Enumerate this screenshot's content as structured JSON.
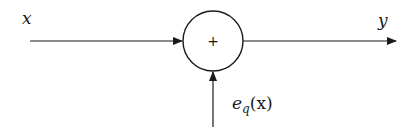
{
  "diagram": {
    "type": "block-diagram",
    "nodes": [
      {
        "id": "sum",
        "shape": "circle",
        "symbol": "+"
      }
    ],
    "labels": {
      "input": "x",
      "output": "y",
      "noise_base": "e",
      "noise_sub": "q",
      "noise_arg": "(x)"
    },
    "edges": [
      {
        "from": "input",
        "to": "sum",
        "label": "x"
      },
      {
        "from": "sum",
        "to": "output",
        "label": "y"
      },
      {
        "from": "noise",
        "to": "sum",
        "label": "e_q(x)"
      }
    ],
    "colors": {
      "stroke": "#1a1a1a",
      "background": "#ffffff"
    }
  }
}
